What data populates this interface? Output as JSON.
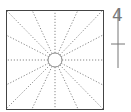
{
  "diagram": {
    "type": "radial-square",
    "square": {
      "x": 6,
      "y": 10,
      "width": 97,
      "height": 99,
      "stroke": "#444444"
    },
    "center_circle": {
      "cx": 55,
      "cy": 60,
      "r": 7,
      "stroke": "#888888"
    },
    "rays": {
      "count": 16,
      "style": "dotted",
      "color": "#888888",
      "endpoints": [
        [
          6,
          10
        ],
        [
          32,
          10
        ],
        [
          55,
          10
        ],
        [
          78,
          10
        ],
        [
          103,
          10
        ],
        [
          103,
          35
        ],
        [
          103,
          60
        ],
        [
          103,
          85
        ],
        [
          103,
          109
        ],
        [
          78,
          109
        ],
        [
          55,
          109
        ],
        [
          32,
          109
        ],
        [
          6,
          109
        ],
        [
          6,
          85
        ],
        [
          6,
          60
        ],
        [
          6,
          35
        ]
      ]
    },
    "side_marker": {
      "label": "4",
      "line": {
        "x": 118,
        "y1": 10,
        "y2": 68
      },
      "tick": {
        "x1": 111,
        "x2": 125,
        "y": 44
      },
      "color": "#777777"
    }
  }
}
